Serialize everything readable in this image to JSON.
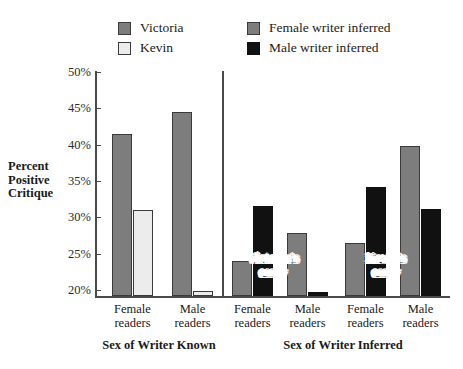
{
  "legend": {
    "left": [
      {
        "label": "Victoria",
        "swatch": "victoria-swatch",
        "color": "#7d7d7d"
      },
      {
        "label": "Kevin",
        "swatch": "kevin-swatch",
        "color": "#ececec"
      }
    ],
    "right": [
      {
        "label": "Female writer inferred",
        "swatch": "female-writer-swatch",
        "color": "#7d7d7d"
      },
      {
        "label": "Male writer inferred",
        "swatch": "male-writer-swatch",
        "color": "#111111"
      }
    ]
  },
  "axis": {
    "ylabel_line1": "Percent",
    "ylabel_line2": "Positive",
    "ylabel_line3": "Critique",
    "yticks": [
      "50%",
      "45%",
      "40%",
      "35%",
      "30%",
      "25%",
      "20%"
    ]
  },
  "groups": {
    "left_title": "Sex of Writer Known",
    "right_title": "Sex of Writer Inferred"
  },
  "categories": [
    {
      "line1": "Female",
      "line2": "readers"
    },
    {
      "line1": "Male",
      "line2": "readers"
    },
    {
      "line1": "Female",
      "line2": "readers"
    },
    {
      "line1": "Male",
      "line2": "readers"
    },
    {
      "line1": "Female",
      "line2": "readers"
    },
    {
      "line1": "Male",
      "line2": "readers"
    }
  ],
  "annotations": [
    {
      "line1": "Victoria's",
      "line2": "essay"
    },
    {
      "line1": "Kevin's",
      "line2": "essay"
    }
  ],
  "chart_data": {
    "type": "bar",
    "title": "",
    "xlabel": "",
    "ylabel": "Percent Positive Critique",
    "ylim": [
      17.5,
      50
    ],
    "ytick_values": [
      50,
      45,
      40,
      35,
      30,
      25,
      20
    ],
    "grid": false,
    "legend_position": "top",
    "panels": [
      {
        "name": "Sex of Writer Known",
        "categories": [
          "Female readers",
          "Male readers"
        ],
        "series": [
          {
            "name": "Victoria",
            "color": "#7d7d7d",
            "values": [
              41.5,
              44.5
            ]
          },
          {
            "name": "Kevin",
            "color": "#ececec",
            "values": [
              31.0,
              19.8
            ]
          }
        ]
      },
      {
        "name": "Sex of Writer Inferred",
        "annotation": "Victoria's essay",
        "categories": [
          "Female readers",
          "Male readers"
        ],
        "series": [
          {
            "name": "Female writer inferred",
            "color": "#7d7d7d",
            "values": [
              24.0,
              27.8
            ]
          },
          {
            "name": "Male writer inferred",
            "color": "#111111",
            "values": [
              31.5,
              19.7
            ]
          }
        ]
      },
      {
        "name": "Sex of Writer Inferred",
        "annotation": "Kevin's essay",
        "categories": [
          "Female readers",
          "Male readers"
        ],
        "series": [
          {
            "name": "Female writer inferred",
            "color": "#7d7d7d",
            "values": [
              26.4,
              39.8
            ]
          },
          {
            "name": "Male writer inferred",
            "color": "#111111",
            "values": [
              34.2,
              31.2
            ]
          }
        ]
      }
    ]
  }
}
